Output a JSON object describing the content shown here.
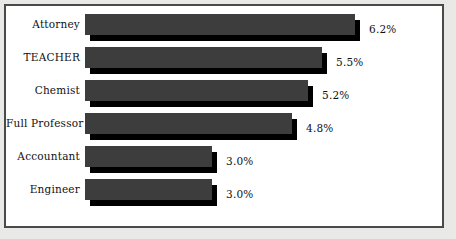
{
  "chart_data": {
    "type": "bar",
    "orientation": "horizontal",
    "title": "",
    "subtitle": "",
    "xlabel": "",
    "ylabel": "",
    "grid": false,
    "legend": null,
    "axis_ticks": [],
    "value_suffix": "%",
    "categories": [
      "Attorney",
      "TEACHER",
      "Chemist",
      "Full Professor",
      "Accountant",
      "Engineer"
    ],
    "values": [
      6.2,
      5.5,
      5.2,
      4.8,
      3.0,
      3.0
    ],
    "value_labels": [
      "6.2%",
      "5.5%",
      "5.2%",
      "4.8%",
      "3.0%",
      "3.0%"
    ],
    "bar_pixel_widths": [
      270,
      237,
      223,
      207,
      127,
      127
    ],
    "bars": [
      {
        "category": "Attorney",
        "value": 6.2,
        "label": "6.2%",
        "width_px": 270
      },
      {
        "category": "TEACHER",
        "value": 5.5,
        "label": "5.5%",
        "width_px": 237
      },
      {
        "category": "Chemist",
        "value": 5.2,
        "label": "5.2%",
        "width_px": 223
      },
      {
        "category": "Full Professor",
        "value": 4.8,
        "label": "4.8%",
        "width_px": 207
      },
      {
        "category": "Accountant",
        "value": 3.0,
        "label": "3.0%",
        "width_px": 127
      },
      {
        "category": "Engineer",
        "value": 3.0,
        "label": "3.0%",
        "width_px": 127
      }
    ],
    "colors": {
      "bar_fill": "#3d3d3d",
      "bar_shadow": "#000000",
      "plot_background": "#ffffff",
      "figure_background": "#e9e9e7",
      "frame_border": "#4a4a4a",
      "text": "#111111"
    },
    "layout": {
      "bar_origin_x": 85,
      "first_row_y": 14,
      "row_pitch": 33,
      "bar_height": 21,
      "shadow_offset": 5,
      "label_column_right": 80,
      "value_gap": 9
    }
  }
}
